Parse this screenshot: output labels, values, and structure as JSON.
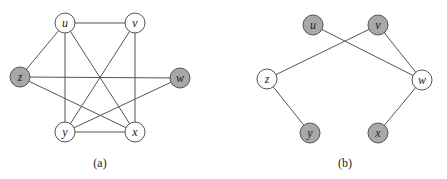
{
  "colors": {
    "gray_fill": "#a8a8a8",
    "white_fill": "#ffffff",
    "stroke": "#555555"
  },
  "node_radius": 10,
  "graphs": [
    {
      "id": "a",
      "caption": "(a)",
      "caption_pos": [
        100,
        163
      ],
      "nodes": [
        {
          "id": "u",
          "label": "u",
          "x": 65,
          "y": 23,
          "shaded": false
        },
        {
          "id": "v",
          "label": "v",
          "x": 135,
          "y": 23,
          "shaded": false
        },
        {
          "id": "z",
          "label": "z",
          "x": 20,
          "y": 77,
          "shaded": true
        },
        {
          "id": "w",
          "label": "w",
          "x": 180,
          "y": 78,
          "shaded": true
        },
        {
          "id": "y",
          "label": "y",
          "x": 65,
          "y": 132,
          "shaded": false
        },
        {
          "id": "x",
          "label": "x",
          "x": 135,
          "y": 132,
          "shaded": false
        }
      ],
      "edges": [
        [
          "u",
          "v"
        ],
        [
          "u",
          "z"
        ],
        [
          "u",
          "y"
        ],
        [
          "u",
          "x"
        ],
        [
          "v",
          "y"
        ],
        [
          "v",
          "x"
        ],
        [
          "z",
          "w"
        ],
        [
          "z",
          "x"
        ],
        [
          "w",
          "y"
        ],
        [
          "y",
          "x"
        ]
      ]
    },
    {
      "id": "b",
      "caption": "(b)",
      "caption_pos": [
        345,
        163
      ],
      "nodes": [
        {
          "id": "u",
          "label": "u",
          "x": 313,
          "y": 25,
          "shaded": true
        },
        {
          "id": "v",
          "label": "v",
          "x": 378,
          "y": 25,
          "shaded": true
        },
        {
          "id": "z",
          "label": "z",
          "x": 267,
          "y": 79,
          "shaded": false
        },
        {
          "id": "w",
          "label": "w",
          "x": 422,
          "y": 80,
          "shaded": false
        },
        {
          "id": "y",
          "label": "y",
          "x": 310,
          "y": 133,
          "shaded": true
        },
        {
          "id": "x",
          "label": "x",
          "x": 378,
          "y": 133,
          "shaded": true
        }
      ],
      "edges": [
        [
          "u",
          "w"
        ],
        [
          "v",
          "z"
        ],
        [
          "v",
          "w"
        ],
        [
          "z",
          "y"
        ],
        [
          "w",
          "x"
        ]
      ]
    }
  ]
}
